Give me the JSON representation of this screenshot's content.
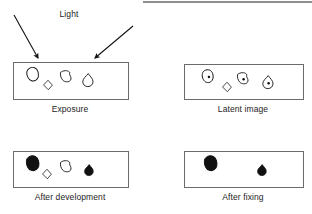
{
  "figure": {
    "background_color": "#ffffff",
    "line_color": "#6b6b6b",
    "ink_color": "#111111",
    "text_color": "#232323",
    "width": 312,
    "height": 214
  },
  "annotations": {
    "light_label": "Light",
    "arrows": [
      {
        "name": "light-arrow-left",
        "x1": 14,
        "y1": 15,
        "x2": 38,
        "y2": 58
      },
      {
        "name": "light-arrow-right",
        "x1": 133,
        "y1": 26,
        "x2": 95,
        "y2": 58
      }
    ]
  },
  "panels": [
    {
      "id": "exposure",
      "label": "Exposure",
      "frame": {
        "x": 13,
        "y": 62,
        "w": 115,
        "h": 37
      },
      "label_x": 70,
      "label_y": 104,
      "grains": [
        {
          "name": "grain-blob-outline",
          "shape": "blob",
          "x": 33,
          "y": 74,
          "scale": 1.05,
          "rotate": -20,
          "fill": "none",
          "dot": false
        },
        {
          "name": "grain-diamond-outline",
          "shape": "diamond",
          "x": 48,
          "y": 85,
          "scale": 0.85,
          "rotate": 0,
          "fill": "none",
          "dot": false
        },
        {
          "name": "grain-wedge-outline",
          "shape": "wedge",
          "x": 66,
          "y": 76,
          "scale": 1.0,
          "rotate": 0,
          "fill": "none",
          "dot": false
        },
        {
          "name": "grain-teardrop-outline",
          "shape": "teardrop",
          "x": 88,
          "y": 80,
          "scale": 1.0,
          "rotate": 0,
          "fill": "none",
          "dot": false
        }
      ]
    },
    {
      "id": "latent-image",
      "label": "Latent image",
      "frame": {
        "x": 184,
        "y": 64,
        "w": 119,
        "h": 35
      },
      "label_x": 243,
      "label_y": 104,
      "grains": [
        {
          "name": "grain-blob-speck",
          "shape": "blob",
          "x": 208,
          "y": 76,
          "scale": 1.0,
          "rotate": -20,
          "fill": "none",
          "dot": true
        },
        {
          "name": "grain-diamond-outline",
          "shape": "diamond",
          "x": 227,
          "y": 87,
          "scale": 0.85,
          "rotate": 0,
          "fill": "none",
          "dot": false
        },
        {
          "name": "grain-wedge-speck",
          "shape": "wedge",
          "x": 243,
          "y": 78,
          "scale": 1.0,
          "rotate": 0,
          "fill": "none",
          "dot": true
        },
        {
          "name": "grain-teardrop-speck",
          "shape": "teardrop",
          "x": 268,
          "y": 82,
          "scale": 1.0,
          "rotate": 0,
          "fill": "none",
          "dot": true
        }
      ]
    },
    {
      "id": "after-development",
      "label": "After development",
      "frame": {
        "x": 13,
        "y": 151,
        "w": 115,
        "h": 36
      },
      "label_x": 70,
      "label_y": 192,
      "grains": [
        {
          "name": "grain-blob-developed",
          "shape": "blob",
          "x": 33,
          "y": 163,
          "scale": 1.15,
          "rotate": -20,
          "fill": "solid",
          "dot": false
        },
        {
          "name": "grain-diamond-outline",
          "shape": "diamond",
          "x": 47,
          "y": 174,
          "scale": 0.85,
          "rotate": 0,
          "fill": "none",
          "dot": false
        },
        {
          "name": "grain-wedge-outline",
          "shape": "wedge",
          "x": 66,
          "y": 166,
          "scale": 1.0,
          "rotate": 0,
          "fill": "none",
          "dot": false
        },
        {
          "name": "grain-teardrop-developed",
          "shape": "teardrop",
          "x": 89,
          "y": 170,
          "scale": 0.85,
          "rotate": 0,
          "fill": "solid",
          "dot": false
        }
      ]
    },
    {
      "id": "after-fixing",
      "label": "After fixing",
      "frame": {
        "x": 184,
        "y": 151,
        "w": 119,
        "h": 36
      },
      "label_x": 243,
      "label_y": 192,
      "grains": [
        {
          "name": "grain-blob-fixed",
          "shape": "blob",
          "x": 211,
          "y": 163,
          "scale": 1.15,
          "rotate": -20,
          "fill": "solid",
          "dot": false
        },
        {
          "name": "grain-teardrop-fixed",
          "shape": "teardrop",
          "x": 262,
          "y": 170,
          "scale": 0.85,
          "rotate": 0,
          "fill": "solid",
          "dot": false
        }
      ]
    }
  ]
}
